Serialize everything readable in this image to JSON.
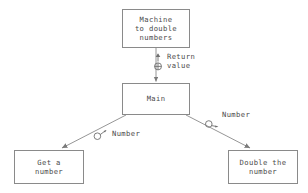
{
  "diagram": {
    "background_color": "#ffffff",
    "line_color": "#8a8a8a",
    "text_color": "#4a4a4a",
    "nodes": [
      {
        "id": "machine",
        "label": "Machine\nto double\nnumbers"
      },
      {
        "id": "main",
        "label": "Main"
      },
      {
        "id": "get",
        "label": "Get a\nnumber"
      },
      {
        "id": "double",
        "label": "Double the\nnumber"
      }
    ],
    "edges": [
      {
        "id": "machine-main",
        "from": "machine",
        "to": "main",
        "label": "Return\nvalue",
        "markers": [
          "up-arrow-icon",
          "circled-plus-icon"
        ]
      },
      {
        "id": "main-get",
        "from": "main",
        "to": "get",
        "label": "Number",
        "markers": [
          "data-flow-circle-arrow-icon"
        ]
      },
      {
        "id": "main-double",
        "from": "main",
        "to": "double",
        "label": "Number",
        "markers": [
          "data-flow-circle-arrow-icon"
        ]
      }
    ]
  }
}
